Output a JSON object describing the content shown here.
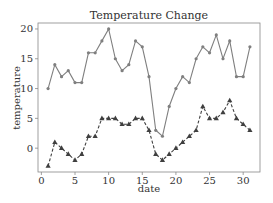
{
  "chart_data": {
    "type": "line",
    "title": "Temperature Change",
    "xlabel": "date",
    "ylabel": "temperature",
    "xlim": [
      -0.5,
      32.5
    ],
    "ylim": [
      -4,
      21
    ],
    "xticks": [
      0,
      5,
      10,
      15,
      20,
      25,
      30
    ],
    "yticks": [
      0,
      5,
      10,
      15,
      20
    ],
    "grid": false,
    "legend": null,
    "x": [
      1,
      2,
      3,
      4,
      5,
      6,
      7,
      8,
      9,
      10,
      11,
      12,
      13,
      14,
      15,
      16,
      17,
      18,
      19,
      20,
      21,
      22,
      23,
      24,
      25,
      26,
      27,
      28,
      29,
      30,
      31
    ],
    "series": [
      {
        "name": "high",
        "marker": "circle",
        "linestyle": "solid",
        "color": "#7f7f7f",
        "values": [
          10,
          14,
          12,
          13,
          11,
          11,
          16,
          16,
          18,
          20,
          15,
          13,
          14,
          18,
          17,
          12,
          3,
          2,
          7,
          10,
          12,
          11,
          15,
          17,
          16,
          19,
          15,
          18,
          12,
          12,
          17
        ]
      },
      {
        "name": "low",
        "marker": "triangle",
        "linestyle": "dashed",
        "color": "#3f3f3f",
        "values": [
          -3,
          1,
          0,
          -1,
          -2,
          -1,
          2,
          2,
          5,
          5,
          5,
          4,
          4,
          5,
          5,
          3,
          -1,
          -2,
          -1,
          0,
          1,
          2,
          3,
          7,
          5,
          5,
          6,
          8,
          5,
          4,
          3
        ]
      }
    ]
  }
}
